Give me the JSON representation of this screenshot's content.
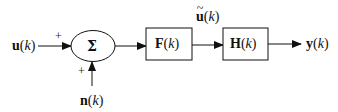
{
  "diagram": {
    "type": "block-diagram",
    "inputs": {
      "u": {
        "symbol": "u",
        "arg": "(k)",
        "sign": "+"
      },
      "n": {
        "symbol": "n",
        "arg": "(k)",
        "sign": "+"
      }
    },
    "summer": {
      "symbol": "Σ"
    },
    "blocks": [
      {
        "symbol": "F",
        "arg": "(k)"
      },
      {
        "symbol": "H",
        "arg": "(k)"
      }
    ],
    "intermediate": {
      "symbol": "u",
      "accent": "~",
      "arg": "(k)"
    },
    "output": {
      "symbol": "y",
      "arg": "(k)"
    },
    "colors": {
      "line": "#111111",
      "background": "#ffffff"
    }
  }
}
